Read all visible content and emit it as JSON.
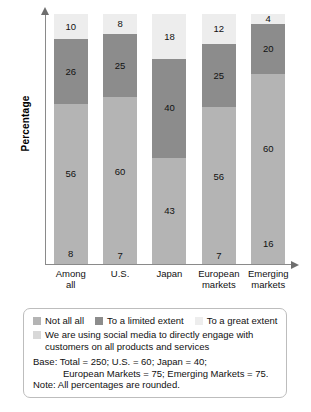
{
  "chart_data": {
    "type": "bar",
    "stacked": true,
    "title": "",
    "xlabel": "",
    "ylabel": "Percentage",
    "ylim": [
      0,
      100
    ],
    "grid": false,
    "legend_position": "bottom",
    "categories": [
      "Among all",
      "U.S.",
      "Japan",
      "European markets",
      "Emerging markets"
    ],
    "series": [
      {
        "name": "Not all all",
        "color": "#b4b4b4",
        "values": [
          8,
          7,
          0,
          7,
          16
        ]
      },
      {
        "name": "We are using social media to directly engage with customers on all products and services",
        "color": "#b4b4b4",
        "values": [
          56,
          60,
          43,
          56,
          60
        ]
      },
      {
        "name": "To a limited extent",
        "color": "#8c8c8c",
        "values": [
          26,
          25,
          40,
          25,
          20
        ]
      },
      {
        "name": "To a great extent",
        "color": "#ededed",
        "values": [
          10,
          8,
          18,
          12,
          4
        ]
      }
    ],
    "bars": [
      {
        "category": "Among all",
        "line1": "Among",
        "line2": "all",
        "segments": [
          {
            "series": "Not all all",
            "value": 8,
            "label": "8",
            "class": "seg-notatall"
          },
          {
            "series": "We are using social media to directly engage with customers on all products and services",
            "value": 56,
            "label": "56",
            "class": "seg-using"
          },
          {
            "series": "To a limited extent",
            "value": 26,
            "label": "26",
            "class": "seg-limited"
          },
          {
            "series": "To a great extent",
            "value": 10,
            "label": "10",
            "class": "seg-great"
          }
        ]
      },
      {
        "category": "U.S.",
        "line1": "U.S.",
        "line2": "",
        "segments": [
          {
            "series": "Not all all",
            "value": 7,
            "label": "7",
            "class": "seg-notatall"
          },
          {
            "series": "We are using social media to directly engage with customers on all products and services",
            "value": 60,
            "label": "60",
            "class": "seg-using"
          },
          {
            "series": "To a limited extent",
            "value": 25,
            "label": "25",
            "class": "seg-limited"
          },
          {
            "series": "To a great extent",
            "value": 8,
            "label": "8",
            "class": "seg-great"
          }
        ]
      },
      {
        "category": "Japan",
        "line1": "Japan",
        "line2": "",
        "segments": [
          {
            "series": "We are using social media to directly engage with customers on all products and services",
            "value": 43,
            "label": "43",
            "class": "seg-using"
          },
          {
            "series": "To a limited extent",
            "value": 40,
            "label": "40",
            "class": "seg-limited"
          },
          {
            "series": "To a great extent",
            "value": 18,
            "label": "18",
            "class": "seg-great"
          }
        ]
      },
      {
        "category": "European markets",
        "line1": "European",
        "line2": "markets",
        "segments": [
          {
            "series": "Not all all",
            "value": 7,
            "label": "7",
            "class": "seg-notatall"
          },
          {
            "series": "We are using social media to directly engage with customers on all products and services",
            "value": 56,
            "label": "56",
            "class": "seg-using"
          },
          {
            "series": "To a limited extent",
            "value": 25,
            "label": "25",
            "class": "seg-limited"
          },
          {
            "series": "To a great extent",
            "value": 12,
            "label": "12",
            "class": "seg-great"
          }
        ]
      },
      {
        "category": "Emerging markets",
        "line1": "Emerging",
        "line2": "markets",
        "segments": [
          {
            "series": "Not all all",
            "value": 16,
            "label": "16",
            "class": "seg-notatall"
          },
          {
            "series": "We are using social media to directly engage with customers on all products and services",
            "value": 60,
            "label": "60",
            "class": "seg-using"
          },
          {
            "series": "To a limited extent",
            "value": 20,
            "label": "20",
            "class": "seg-limited"
          },
          {
            "series": "To a great extent",
            "value": 4,
            "label": "4",
            "class": "seg-great"
          }
        ]
      }
    ]
  },
  "axis": {
    "y_title": "Percentage"
  },
  "legend": {
    "inline_items": [
      {
        "label": "Not all all",
        "color": "#b4b4b4"
      },
      {
        "label": "To a limited extent",
        "color": "#8c8c8c"
      },
      {
        "label": "To a great extent",
        "color": "#ededed"
      }
    ],
    "wrapped_item": {
      "label": "We are using social media to directly engage with customers on all products and services",
      "color": "#d8d8d8"
    }
  },
  "footnotes": {
    "line1": "Base: Total = 250; U.S. = 60; Japan = 40;",
    "line2": "European Markets = 75; Emerging Markets = 75.",
    "line3": "Note: All percentages are rounded."
  }
}
